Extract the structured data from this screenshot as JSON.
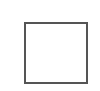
{
  "icon": {
    "name": "maximize-icon",
    "stroke_color": "#555555",
    "background": "#ffffff"
  }
}
